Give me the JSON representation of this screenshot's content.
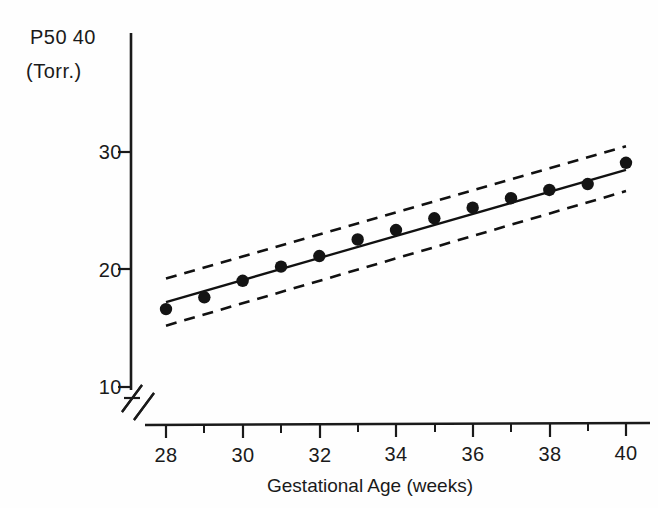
{
  "chart_data": {
    "type": "scatter",
    "title": "",
    "xlabel": "Gestational Age (weeks)",
    "ylabel_line1": "P50",
    "ylabel_line2": "(Torr.)",
    "xlim": [
      27.4,
      40.6
    ],
    "ylim": [
      10,
      40
    ],
    "grid": false,
    "legend": "none",
    "axis_break": {
      "axis": "y",
      "symbol": "//",
      "below_value": 10
    },
    "x_ticks_major": [
      28,
      30,
      32,
      34,
      36,
      38,
      40
    ],
    "x_ticks_major_labels": [
      "28",
      "30",
      "32",
      "34",
      "36",
      "38",
      "40"
    ],
    "x_ticks_minor": [
      29,
      31,
      33,
      35,
      37,
      39
    ],
    "y_ticks": [
      10,
      20,
      30,
      40
    ],
    "y_tick_labels": [
      "10",
      "20",
      "30",
      "40"
    ],
    "x": [
      28,
      29,
      30,
      31,
      32,
      33,
      34,
      35,
      36,
      37,
      38,
      39,
      40
    ],
    "values": [
      16.6,
      17.6,
      19.0,
      20.2,
      21.1,
      22.5,
      23.3,
      24.3,
      25.2,
      26.0,
      26.7,
      27.2,
      29.0
    ],
    "series": [
      {
        "name": "P50 observations",
        "style": "filled-circle",
        "values": [
          16.6,
          17.6,
          19.0,
          20.2,
          21.1,
          22.5,
          23.3,
          24.3,
          25.2,
          26.0,
          26.7,
          27.2,
          29.0
        ]
      },
      {
        "name": "regression line",
        "style": "solid",
        "x": [
          28,
          40
        ],
        "values": [
          17.2,
          28.4
        ]
      },
      {
        "name": "upper confidence band",
        "style": "dashed",
        "x": [
          28,
          40
        ],
        "values": [
          19.2,
          30.4
        ]
      },
      {
        "name": "lower confidence band",
        "style": "dashed",
        "x": [
          28,
          40
        ],
        "values": [
          15.2,
          26.6
        ]
      }
    ],
    "annotations": []
  },
  "colors": {
    "ink": "#141414",
    "background": "#fefefe"
  }
}
